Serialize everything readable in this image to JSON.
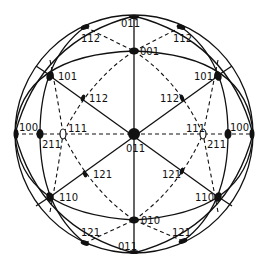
{
  "diagram": {
    "poles": [
      {
        "id": "c011",
        "label": "011",
        "kind": "filled",
        "size": "large"
      },
      {
        "id": "t011",
        "label": "011",
        "kind": "filled",
        "size": "edge"
      },
      {
        "id": "b011",
        "label": "011",
        "kind": "filled",
        "size": "edge"
      },
      {
        "id": "p001",
        "label": "001",
        "kind": "filled",
        "size": "medium"
      },
      {
        "id": "p010",
        "label": "010",
        "kind": "filled",
        "size": "medium"
      },
      {
        "id": "l100",
        "label": "100",
        "kind": "filled",
        "size": "edge"
      },
      {
        "id": "r100",
        "label": "100",
        "kind": "filled",
        "size": "edge"
      },
      {
        "id": "l211",
        "label": "211",
        "kind": "filled",
        "size": "medium"
      },
      {
        "id": "r211",
        "label": "211",
        "kind": "filled",
        "size": "medium"
      },
      {
        "id": "l111",
        "label": "111",
        "kind": "open",
        "size": "medium"
      },
      {
        "id": "r111",
        "label": "111",
        "kind": "open",
        "size": "medium"
      },
      {
        "id": "l101",
        "label": "101",
        "kind": "filled",
        "size": "medium"
      },
      {
        "id": "r101",
        "label": "101",
        "kind": "filled",
        "size": "medium"
      },
      {
        "id": "l110",
        "label": "110",
        "kind": "filled",
        "size": "medium"
      },
      {
        "id": "r110",
        "label": "110",
        "kind": "filled",
        "size": "medium"
      },
      {
        "id": "lo112",
        "label": "112",
        "kind": "filled",
        "size": "edge"
      },
      {
        "id": "ro112",
        "label": "112",
        "kind": "filled",
        "size": "edge"
      },
      {
        "id": "li112",
        "label": "112",
        "kind": "filled",
        "size": "small"
      },
      {
        "id": "ri112",
        "label": "112",
        "kind": "filled",
        "size": "small"
      },
      {
        "id": "li121",
        "label": "121",
        "kind": "filled",
        "size": "small"
      },
      {
        "id": "ri121",
        "label": "121",
        "kind": "filled",
        "size": "small"
      },
      {
        "id": "lo121",
        "label": "121",
        "kind": "filled",
        "size": "edge"
      },
      {
        "id": "ro121",
        "label": "121",
        "kind": "filled",
        "size": "edge"
      }
    ]
  },
  "labels": {
    "c011": "011",
    "t011": "011",
    "b011": "011",
    "p001": "001",
    "p010": "010",
    "l100": "100",
    "r100": "100",
    "l211": "211",
    "r211": "211",
    "l111": "111",
    "r111": "111",
    "l101": "101",
    "r101": "101",
    "l110": "110",
    "r110": "110",
    "lo112": "112",
    "ro112": "112",
    "li112": "112",
    "ri112": "112",
    "li121": "121",
    "ri121": "121",
    "lo121": "121",
    "ro121": "121"
  }
}
